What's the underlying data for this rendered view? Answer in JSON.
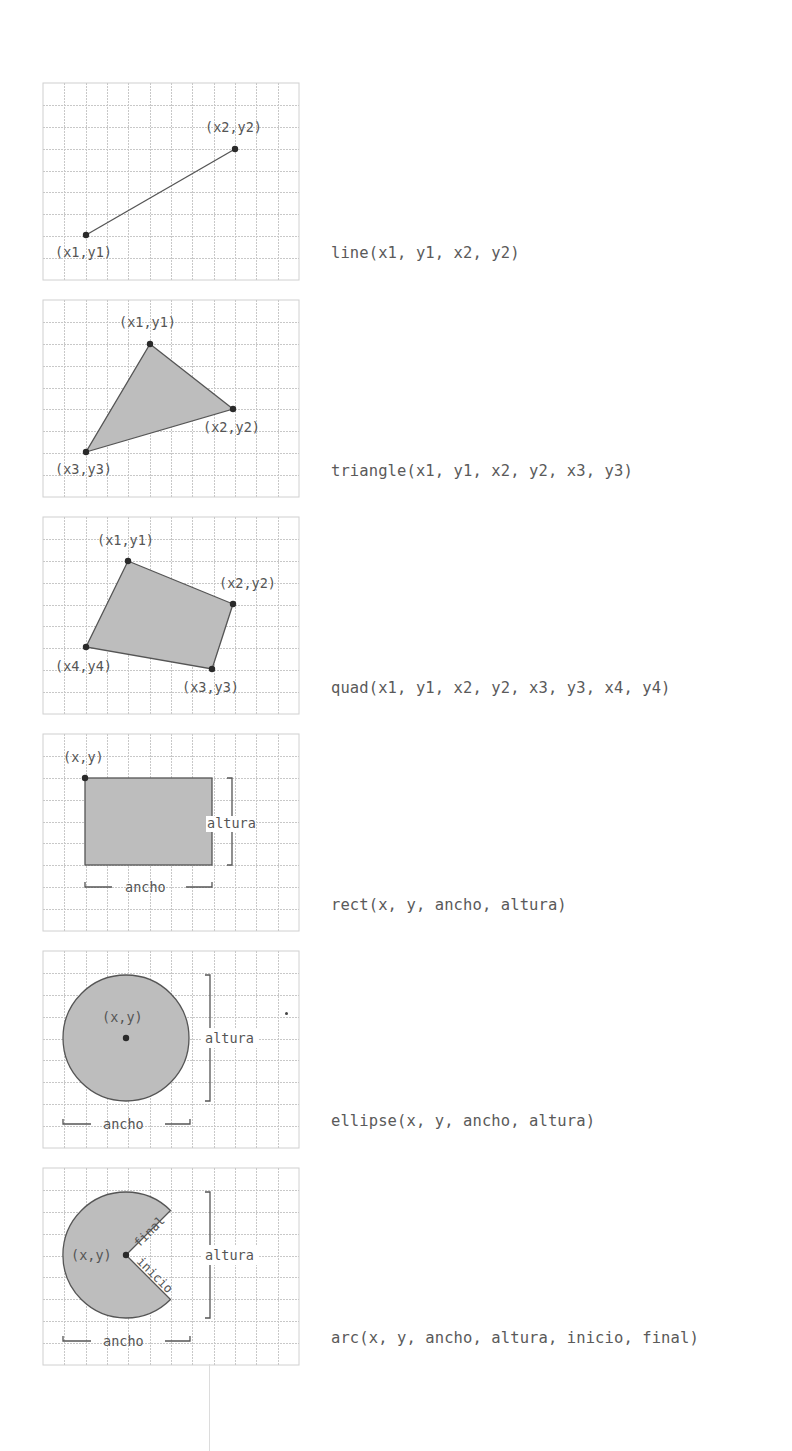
{
  "figure": {
    "grid": {
      "columns": 12,
      "rows": 9,
      "cell_px": 21.3,
      "line_color": "#c8c8c8",
      "border_color": "#d0d0d0"
    },
    "colors": {
      "shape_fill": "#bdbdbd",
      "shape_stroke": "#555555",
      "point": "#2a2a2a",
      "label": "#555555",
      "code": "#5a5a5a"
    }
  },
  "panels": [
    {
      "name": "line",
      "code": "line(x1, y1, x2, y2)",
      "labels": {
        "p1": "(x1,y1)",
        "p2": "(x2,y2)"
      }
    },
    {
      "name": "triangle",
      "code": "triangle(x1, y1, x2, y2, x3, y3)",
      "labels": {
        "p1": "(x1,y1)",
        "p2": "(x2,y2)",
        "p3": "(x3,y3)"
      }
    },
    {
      "name": "quad",
      "code": "quad(x1, y1, x2, y2, x3, y3, x4, y4)",
      "labels": {
        "p1": "(x1,y1)",
        "p2": "(x2,y2)",
        "p3": "(x3,y3)",
        "p4": "(x4,y4)"
      }
    },
    {
      "name": "rect",
      "code": "rect(x, y, ancho, altura)",
      "labels": {
        "origin": "(x,y)",
        "width": "ancho",
        "height": "altura"
      }
    },
    {
      "name": "ellipse",
      "code": "ellipse(x, y, ancho, altura)",
      "labels": {
        "center": "(x,y)",
        "width": "ancho",
        "height": "altura"
      }
    },
    {
      "name": "arc",
      "code": "arc(x, y, ancho, altura, inicio, final)",
      "labels": {
        "center": "(x,y)",
        "width": "ancho",
        "height": "altura",
        "start": "inicio",
        "stop": "final"
      }
    }
  ]
}
